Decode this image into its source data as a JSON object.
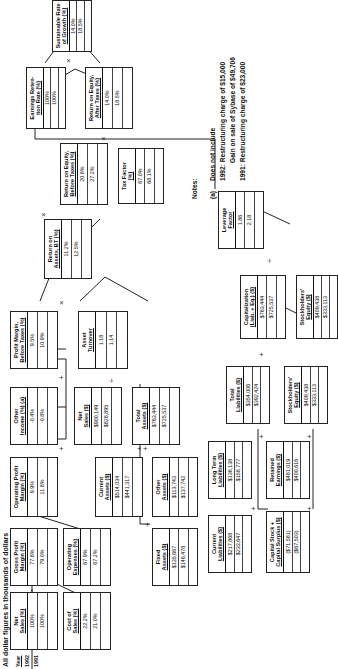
{
  "title": "All dollar figures in thousands of dollars",
  "years": {
    "header": "Year",
    "y1": "1992",
    "y2": "1991"
  },
  "boxes": {
    "net_sales_pct": {
      "l1": "Net",
      "l2": "Sales (%)",
      "v1992": "100%",
      "v1991": "100%"
    },
    "gross_profit_margin": {
      "l1": "Gross Profit",
      "l2": "Margin (%)",
      "v1992": "77.8%",
      "v1991": "79.0%"
    },
    "cost_of_sales": {
      "l1": "Cost of",
      "l2": "Sales (%)",
      "v1992": "22.2%",
      "v1991": "21.0%"
    },
    "operating_expenses": {
      "l1": "Operating",
      "l2": "Expenses (%)",
      "v1992": "67.9%",
      "v1991": "67.2%"
    },
    "operating_profit_margin": {
      "l1": "Operating Profit",
      "l2": "Margin (%)",
      "v1992": "9.9%",
      "v1991": "11.8%"
    },
    "other_income": {
      "l1": "Other",
      "l2": "Income (%) (a)",
      "v1992": "-0.4%",
      "v1991": "-0.8%"
    },
    "profit_margin_bt": {
      "l1": "Profit Margin,",
      "l2": "Before Taxes (%)",
      "v1992": "9.5%",
      "v1991": "10.9%"
    },
    "asset_turnover": {
      "l1": "Asset",
      "l2": "Turnover",
      "v1992": "1.18",
      "v1991": "1.14"
    },
    "net_sales_dollars": {
      "l1": "Net",
      "l2": "Sales ($)",
      "v1992": "$900,149",
      "v1991": "$828,895"
    },
    "total_assets": {
      "l1": "Total",
      "l2": "Assets ($)",
      "v1992": "$763,444",
      "v1991": "$725,537"
    },
    "current_assets": {
      "l1": "Current",
      "l2": "Assets ($)",
      "v1992": "$514,034",
      "v1991": "$441,317"
    },
    "other_assets": {
      "l1": "Other",
      "l2": "Assets ($)",
      "v1992": "$113,743",
      "v1991": "$137,742"
    },
    "fixed_assets": {
      "l1": "Fixed",
      "l2": "Assets ($)",
      "v1992": "$135,667",
      "v1991": "$146,478"
    },
    "return_on_assets_bt": {
      "l1": "Return on",
      "l2": "Assets, BT (%)",
      "v1992": "11.2%",
      "v1991": "12.5%"
    },
    "return_on_equity_bt": {
      "l1": "Return on Equity,",
      "l2": "Before Taxes (%)",
      "v1992": "20.8%",
      "v1991": "27.2%"
    },
    "tax_factor": {
      "l1": "Tax Factor",
      "l2": "(%)",
      "v1992": "67.0%",
      "v1991": "68.1%"
    },
    "return_on_equity_at": {
      "l1": "Return on Equity,",
      "l2": "After Taxes (%)",
      "v1992": "14.0%",
      "v1991": "18.5%"
    },
    "earnings_retention": {
      "l1": "Earnings Reten-",
      "l2": "tion Rate (%)",
      "v1992": "100%",
      "v1991": "100%"
    },
    "sustainable_growth": {
      "l1": "Sustainable Rate",
      "l2": "of Growth (%)",
      "v1992": "14.0%",
      "v1991": "18.5%"
    },
    "leverage_factor": {
      "l1": "Leverage",
      "l2": "Factor",
      "v1992": "1.86",
      "v1991": "2.18"
    },
    "capitalization": {
      "l1": "Capitalization",
      "l2": "(Liab. + Eq.) ($)",
      "v1992": "$763,444",
      "v1991": "$725,537"
    },
    "total_liabilities": {
      "l1": "Total",
      "l2": "Liabilities ($)",
      "v1992": "$354,006",
      "v1991": "$392,424"
    },
    "stockholders_equity_a": {
      "l1": "Stockholders'",
      "l2": "Equity ($)",
      "v1992": "$409,438",
      "v1991": "$333,113"
    },
    "stockholders_equity_b": {
      "l1": "Stockholders'",
      "l2": "Equity ($)",
      "v1992": "$409,438",
      "v1991": "$333,113"
    },
    "long_term_liabilities": {
      "l1": "Long Term",
      "l2": "Liabilities ($)",
      "v1992": "$136,138",
      "v1991": "$158,777"
    },
    "current_liabilities": {
      "l1": "Current",
      "l2": "Liabilities ($)",
      "v1992": "$217,868",
      "v1991": "$233,647"
    },
    "retained_earnings": {
      "l1": "Retained",
      "l2": "Earnings ($)",
      "v1992": "$481,019",
      "v1991": "$400,616"
    },
    "capital_stock_surplus": {
      "l1": "Capital Stock +",
      "l2": "Capital Surplus ($)",
      "v1992": "($71,581)",
      "v1991": "($67,503)"
    }
  },
  "operators": {
    "minus": "—",
    "plus": "+",
    "times": "×",
    "divide": "÷"
  },
  "notes": {
    "label": "Notes:",
    "marker": "(a)",
    "line1": "Does not include",
    "line2": "1992:  Restructuring charge of $15,000",
    "line3": "Gain on sale of Sybase of $49,706",
    "line4": "1991:  Restructuring charge of $23,000"
  }
}
